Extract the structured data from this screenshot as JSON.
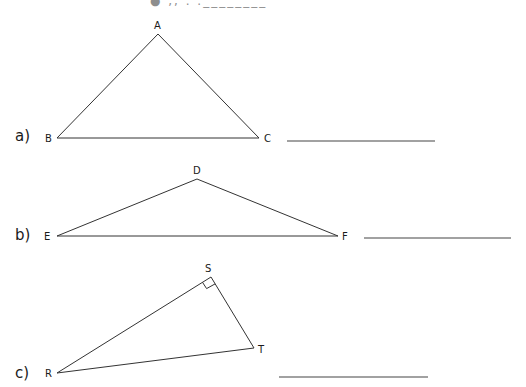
{
  "header": {
    "clipped_text": "● ,, . .________"
  },
  "questions": [
    {
      "label": "a)",
      "vertices": {
        "A": {
          "label": "A",
          "x": 158,
          "y": 34
        },
        "B": {
          "label": "B",
          "x": 57,
          "y": 138
        },
        "C": {
          "label": "C",
          "x": 259,
          "y": 138
        }
      },
      "answer_line": {
        "x1": 287,
        "x2": 435,
        "y": 141
      },
      "right_angle_at": null
    },
    {
      "label": "b)",
      "vertices": {
        "D": {
          "label": "D",
          "x": 197,
          "y": 179
        },
        "E": {
          "label": "E",
          "x": 57,
          "y": 236
        },
        "F": {
          "label": "F",
          "x": 338,
          "y": 236
        }
      },
      "answer_line": {
        "x1": 364,
        "x2": 511,
        "y": 238
      },
      "right_angle_at": null
    },
    {
      "label": "c)",
      "vertices": {
        "S": {
          "label": "S",
          "x": 211,
          "y": 277
        },
        "R": {
          "label": "R",
          "x": 57,
          "y": 373
        },
        "T": {
          "label": "T",
          "x": 254,
          "y": 348
        }
      },
      "answer_line": {
        "x1": 279,
        "x2": 428,
        "y": 377
      },
      "right_angle_at": "S"
    }
  ],
  "colors": {
    "line": "#333333",
    "text": "#1a1a1a",
    "background": "#ffffff"
  }
}
